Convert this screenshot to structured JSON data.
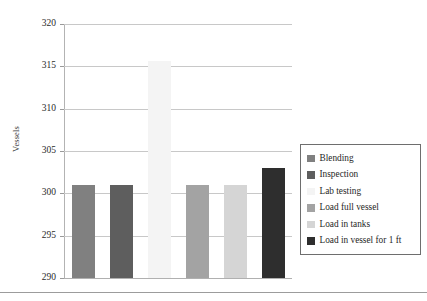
{
  "chart_data": {
    "type": "bar",
    "title": "",
    "subtitle": "",
    "xlabel": "",
    "ylabel": "Vessels",
    "ylim": [
      290,
      320
    ],
    "ytick_step": 5,
    "ytick_labels": [
      "320",
      "315",
      "310",
      "305",
      "300",
      "295",
      "290"
    ],
    "yticks": [
      320,
      315,
      310,
      305,
      300,
      295,
      290
    ],
    "grid": true,
    "grid_axis": "y",
    "xtick_labels": [],
    "legend_position": "right",
    "categories": [
      "Blending",
      "Inspection",
      "Lab testing",
      "Load full vessel",
      "Load in tanks",
      "Load in vessel for 1 ft"
    ],
    "values": [
      301,
      301,
      315.6,
      301,
      301,
      303
    ],
    "colors": [
      "#808080",
      "#5e5e5e",
      "#f4f4f4",
      "#a3a3a3",
      "#d5d5d5",
      "#2e2e2e"
    ],
    "series": [
      {
        "name": "Vessels",
        "values": [
          301,
          301,
          315.6,
          301,
          301,
          303
        ]
      }
    ]
  },
  "axis": {
    "y_title": "Vessels",
    "ticks": [
      {
        "label": "320",
        "value": 320
      },
      {
        "label": "315",
        "value": 315
      },
      {
        "label": "310",
        "value": 310
      },
      {
        "label": "305",
        "value": 305
      },
      {
        "label": "300",
        "value": 300
      },
      {
        "label": "295",
        "value": 295
      },
      {
        "label": "290",
        "value": 290
      }
    ]
  },
  "legend": {
    "items": [
      {
        "label": "Blending",
        "color": "#808080"
      },
      {
        "label": "Inspection",
        "color": "#5e5e5e"
      },
      {
        "label": "Lab testing",
        "color": "#f4f4f4"
      },
      {
        "label": "Load full vessel",
        "color": "#a3a3a3"
      },
      {
        "label": "Load in tanks",
        "color": "#d5d5d5"
      },
      {
        "label": "Load in vessel for 1 ft",
        "color": "#2e2e2e"
      }
    ]
  }
}
